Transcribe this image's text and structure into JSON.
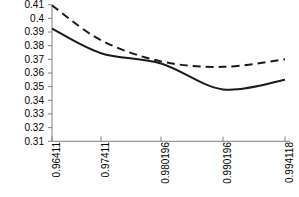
{
  "chart_data": {
    "type": "line",
    "title": "",
    "xlabel": "",
    "ylabel": "",
    "ylim": [
      0.31,
      0.41
    ],
    "grid": false,
    "legend": "none",
    "x_tick_rotation": -90,
    "categories": [
      "0.96411",
      "0.97411",
      "0.980196",
      "0.990196",
      "0.994118"
    ],
    "x": [
      0.96411,
      0.97411,
      0.980196,
      0.990196,
      0.994118
    ],
    "yticks": [
      "0.41",
      "0.4",
      "0.39",
      "0.38",
      "0.37",
      "0.36",
      "0.35",
      "0.34",
      "0.33",
      "0.32",
      "0.31"
    ],
    "ytick_values": [
      0.41,
      0.4,
      0.39,
      0.38,
      0.37,
      0.36,
      0.35,
      0.34,
      0.33,
      0.32,
      0.31
    ],
    "series": [
      {
        "name": "dashed-series",
        "style": "dashed",
        "color": "#1a1a1a",
        "values": [
          0.4095,
          0.384,
          0.3685,
          0.3645,
          0.37
        ]
      },
      {
        "name": "solid-series",
        "style": "solid",
        "color": "#1a1a1a",
        "values": [
          0.3925,
          0.3745,
          0.367,
          0.348,
          0.355
        ]
      }
    ],
    "series_detail": [
      {
        "name": "dashed-series",
        "points": [
          [
            0.96411,
            0.4095
          ],
          [
            0.97411,
            0.384
          ],
          [
            0.980196,
            0.3685
          ],
          [
            0.990196,
            0.3645
          ],
          [
            0.994118,
            0.37
          ]
        ]
      },
      {
        "name": "solid-series",
        "points": [
          [
            0.96411,
            0.3925
          ],
          [
            0.97411,
            0.3745
          ],
          [
            0.980196,
            0.367
          ],
          [
            0.990196,
            0.348
          ],
          [
            0.994118,
            0.355
          ]
        ]
      }
    ]
  },
  "axis": {
    "line_color": "#808080",
    "tick_color": "#808080"
  }
}
